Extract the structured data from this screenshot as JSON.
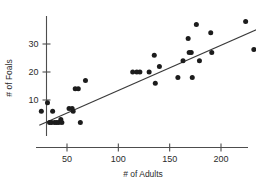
{
  "chart_data": {
    "type": "scatter",
    "title": "",
    "xlabel": "# of Adults",
    "ylabel": "# of Foals",
    "xlim": [
      20,
      248
    ],
    "ylim": [
      0,
      40
    ],
    "xticks": [
      50,
      100,
      150,
      200
    ],
    "xtick_labels": [
      "50",
      "100",
      "150",
      "200"
    ],
    "yticks": [
      10,
      20,
      30
    ],
    "ytick_labels": [
      "10",
      "20",
      "30"
    ],
    "grid": false,
    "legend": null,
    "points": [
      {
        "x": 25,
        "y": 6
      },
      {
        "x": 31,
        "y": 9
      },
      {
        "x": 33,
        "y": 2
      },
      {
        "x": 35,
        "y": 2
      },
      {
        "x": 36,
        "y": 6
      },
      {
        "x": 38,
        "y": 2
      },
      {
        "x": 40,
        "y": 2
      },
      {
        "x": 42,
        "y": 2
      },
      {
        "x": 44,
        "y": 3
      },
      {
        "x": 45,
        "y": 2
      },
      {
        "x": 52,
        "y": 7
      },
      {
        "x": 55,
        "y": 7
      },
      {
        "x": 56,
        "y": 6
      },
      {
        "x": 58,
        "y": 14
      },
      {
        "x": 61,
        "y": 14
      },
      {
        "x": 63,
        "y": 2
      },
      {
        "x": 68,
        "y": 17
      },
      {
        "x": 114,
        "y": 20
      },
      {
        "x": 118,
        "y": 20
      },
      {
        "x": 121,
        "y": 20
      },
      {
        "x": 130,
        "y": 20
      },
      {
        "x": 135,
        "y": 26
      },
      {
        "x": 136,
        "y": 16
      },
      {
        "x": 140,
        "y": 22
      },
      {
        "x": 158,
        "y": 18
      },
      {
        "x": 163,
        "y": 24
      },
      {
        "x": 168,
        "y": 32
      },
      {
        "x": 169,
        "y": 27
      },
      {
        "x": 171,
        "y": 27
      },
      {
        "x": 172,
        "y": 18
      },
      {
        "x": 176,
        "y": 37
      },
      {
        "x": 179,
        "y": 24
      },
      {
        "x": 190,
        "y": 34
      },
      {
        "x": 191,
        "y": 27
      },
      {
        "x": 224,
        "y": 38
      },
      {
        "x": 232,
        "y": 28
      },
      {
        "x": 239,
        "y": 28
      },
      {
        "x": 240,
        "y": 27
      }
    ],
    "fit_line": {
      "label": "least-squares line",
      "x1": 23,
      "y1": 1,
      "x2": 246,
      "y2": 37
    }
  }
}
